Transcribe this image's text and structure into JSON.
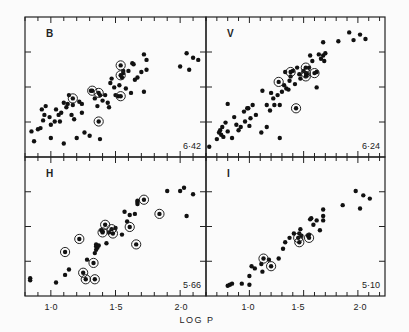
{
  "chart_data": {
    "type": "scatter",
    "title": "",
    "xlabel": "LOG P",
    "ylabel": "",
    "grid": false,
    "legend": "none",
    "shared_xlabel": "LOG P",
    "panels": [
      {
        "band": "B",
        "slope_label": "6·42",
        "position": "top-left",
        "xlim": [
          0.8,
          2.2
        ],
        "ylim": [
          0,
          1
        ],
        "x_ticks": [
          "1·0",
          "1·5",
          "2·0"
        ],
        "points": [
          [
            0.85,
            0.16
          ],
          [
            0.87,
            0.07
          ],
          [
            0.9,
            0.18
          ],
          [
            0.92,
            0.19
          ],
          [
            0.94,
            0.26
          ],
          [
            0.96,
            0.39
          ],
          [
            0.93,
            0.36
          ],
          [
            0.95,
            0.31
          ],
          [
            0.99,
            0.29
          ],
          [
            1.0,
            0.22
          ],
          [
            1.03,
            0.25
          ],
          [
            1.0,
            0.1
          ],
          [
            1.04,
            0.36
          ],
          [
            1.06,
            0.31
          ],
          [
            1.07,
            0.25
          ],
          [
            1.08,
            0.33
          ],
          [
            1.1,
            0.42
          ],
          [
            1.12,
            0.38
          ],
          [
            1.13,
            0.41
          ],
          [
            1.14,
            0.49
          ],
          [
            1.16,
            0.31
          ],
          [
            1.17,
            0.4
          ],
          [
            1.18,
            0.27
          ],
          [
            1.2,
            0.1
          ],
          [
            1.22,
            0.43
          ],
          [
            1.24,
            0.33
          ],
          [
            1.26,
            0.15
          ],
          [
            1.3,
            0.12
          ],
          [
            1.31,
            0.53
          ],
          [
            1.34,
            0.46
          ],
          [
            1.36,
            0.39
          ],
          [
            1.38,
            0.49
          ],
          [
            1.4,
            0.44
          ],
          [
            1.42,
            0.49
          ],
          [
            1.44,
            0.42
          ],
          [
            1.46,
            0.6
          ],
          [
            1.47,
            0.64
          ],
          [
            1.49,
            0.56
          ],
          [
            1.5,
            0.49
          ],
          [
            1.52,
            0.48
          ],
          [
            1.53,
            0.58
          ],
          [
            1.55,
            0.65
          ],
          [
            1.56,
            0.69
          ],
          [
            1.56,
            0.71
          ],
          [
            1.58,
            0.55
          ],
          [
            1.6,
            0.71
          ],
          [
            1.62,
            0.51
          ],
          [
            1.65,
            0.63
          ],
          [
            1.63,
            0.78
          ],
          [
            1.64,
            0.77
          ],
          [
            1.67,
            0.65
          ],
          [
            1.7,
            0.7
          ],
          [
            1.72,
            0.52
          ],
          [
            1.74,
            0.72
          ],
          [
            1.74,
            0.81
          ],
          [
            1.72,
            0.86
          ],
          [
            2.0,
            0.75
          ],
          [
            2.05,
            0.87
          ],
          [
            2.07,
            0.72
          ],
          [
            2.1,
            0.83
          ],
          [
            2.14,
            0.81
          ],
          [
            1.24,
            0.41
          ],
          [
            1.45,
            0.38
          ],
          [
            1.1,
            0.05
          ],
          [
            1.38,
            0.09
          ]
        ],
        "circled": [
          [
            1.17,
            0.46
          ],
          [
            1.32,
            0.53
          ],
          [
            1.37,
            0.51
          ],
          [
            1.37,
            0.25
          ],
          [
            1.54,
            0.48
          ],
          [
            1.54,
            0.67
          ],
          [
            1.54,
            0.76
          ]
        ]
      },
      {
        "band": "V",
        "slope_label": "6·24",
        "position": "top-right",
        "xlim": [
          0.6,
          2.25
        ],
        "ylim": [
          0,
          1
        ],
        "x_ticks": [
          "1·0",
          "1·5",
          "2·0"
        ],
        "points": [
          [
            0.63,
            0.02
          ],
          [
            0.7,
            0.09
          ],
          [
            0.72,
            0.15
          ],
          [
            0.73,
            0.17
          ],
          [
            0.74,
            0.13
          ],
          [
            0.75,
            0.2
          ],
          [
            0.76,
            0.11
          ],
          [
            0.78,
            0.24
          ],
          [
            0.8,
            0.16
          ],
          [
            0.8,
            0.41
          ],
          [
            0.84,
            0.1
          ],
          [
            0.86,
            0.29
          ],
          [
            0.88,
            0.22
          ],
          [
            0.9,
            0.17
          ],
          [
            0.92,
            0.2
          ],
          [
            0.95,
            0.34
          ],
          [
            0.96,
            0.25
          ],
          [
            0.98,
            0.37
          ],
          [
            0.99,
            0.37
          ],
          [
            1.0,
            0.21
          ],
          [
            1.01,
            0.28
          ],
          [
            1.03,
            0.4
          ],
          [
            1.06,
            0.31
          ],
          [
            1.11,
            0.15
          ],
          [
            1.12,
            0.53
          ],
          [
            1.16,
            0.4
          ],
          [
            1.16,
            0.2
          ],
          [
            1.19,
            0.35
          ],
          [
            1.2,
            0.51
          ],
          [
            1.22,
            0.46
          ],
          [
            1.23,
            0.4
          ],
          [
            1.26,
            0.49
          ],
          [
            1.28,
            0.4
          ],
          [
            1.3,
            0.52
          ],
          [
            1.32,
            0.58
          ],
          [
            1.34,
            0.55
          ],
          [
            1.33,
            0.7
          ],
          [
            1.36,
            0.54
          ],
          [
            1.37,
            0.62
          ],
          [
            1.38,
            0.66
          ],
          [
            1.4,
            0.71
          ],
          [
            1.42,
            0.59
          ],
          [
            1.44,
            0.74
          ],
          [
            1.46,
            0.68
          ],
          [
            1.47,
            0.64
          ],
          [
            1.5,
            0.71
          ],
          [
            1.53,
            0.68
          ],
          [
            1.55,
            0.74
          ],
          [
            1.56,
            0.85
          ],
          [
            1.58,
            0.8
          ],
          [
            1.62,
            0.7
          ],
          [
            1.64,
            0.86
          ],
          [
            1.66,
            0.82
          ],
          [
            1.68,
            0.85
          ],
          [
            1.69,
            0.8
          ],
          [
            1.7,
            0.87
          ],
          [
            1.68,
            0.97
          ],
          [
            1.82,
            0.98
          ],
          [
            1.62,
            0.56
          ],
          [
            1.92,
            1.06
          ],
          [
            1.96,
            0.99
          ],
          [
            2.02,
            1.04
          ],
          [
            2.07,
            1.0
          ],
          [
            1.28,
            0.1
          ]
        ],
        "circled": [
          [
            1.27,
            0.61
          ],
          [
            1.38,
            0.7
          ],
          [
            1.43,
            0.37
          ],
          [
            1.52,
            0.66
          ],
          [
            1.52,
            0.69
          ],
          [
            1.52,
            0.74
          ],
          [
            1.6,
            0.69
          ]
        ]
      },
      {
        "band": "H",
        "slope_label": "5·66",
        "position": "bottom-left",
        "xlim": [
          0.8,
          2.2
        ],
        "ylim": [
          0,
          1
        ],
        "x_ticks": [
          "1·0",
          "1·5",
          "2·0"
        ],
        "points": [
          [
            0.84,
            0.09
          ],
          [
            0.84,
            0.07
          ],
          [
            1.04,
            0.05
          ],
          [
            1.11,
            0.12
          ],
          [
            1.14,
            0.17
          ],
          [
            1.28,
            0.26
          ],
          [
            1.34,
            0.32
          ],
          [
            1.35,
            0.4
          ],
          [
            1.35,
            0.38
          ],
          [
            1.36,
            0.37
          ],
          [
            1.35,
            0.35
          ],
          [
            1.37,
            0.39
          ],
          [
            1.39,
            0.53
          ],
          [
            1.4,
            0.52
          ],
          [
            1.43,
            0.41
          ],
          [
            1.45,
            0.51
          ],
          [
            1.5,
            0.55
          ],
          [
            1.55,
            0.49
          ],
          [
            1.57,
            0.7
          ],
          [
            1.59,
            0.61
          ],
          [
            1.61,
            0.67
          ],
          [
            1.65,
            0.68
          ],
          [
            1.67,
            0.79
          ],
          [
            1.67,
            0.8
          ],
          [
            1.67,
            0.77
          ],
          [
            1.9,
            0.89
          ],
          [
            2.0,
            0.89
          ],
          [
            2.03,
            0.92
          ],
          [
            2.05,
            0.66
          ],
          [
            2.1,
            0.86
          ]
        ],
        "circled": [
          [
            1.11,
            0.33
          ],
          [
            1.22,
            0.45
          ],
          [
            1.25,
            0.14
          ],
          [
            1.27,
            0.08
          ],
          [
            1.33,
            0.23
          ],
          [
            1.34,
            0.08
          ],
          [
            1.4,
            0.51
          ],
          [
            1.42,
            0.58
          ],
          [
            1.47,
            0.54
          ],
          [
            1.48,
            0.5
          ],
          [
            1.61,
            0.56
          ],
          [
            1.66,
            0.4
          ],
          [
            1.72,
            0.81
          ],
          [
            1.84,
            0.68
          ]
        ]
      },
      {
        "band": "I",
        "slope_label": "5·10",
        "position": "bottom-right",
        "xlim": [
          0.6,
          2.25
        ],
        "ylim": [
          0,
          1
        ],
        "x_ticks": [
          "1·0",
          "1·5",
          "2·0"
        ],
        "points": [
          [
            0.8,
            0.02
          ],
          [
            0.82,
            0.03
          ],
          [
            0.84,
            0.04
          ],
          [
            0.93,
            0.04
          ],
          [
            1.0,
            0.03
          ],
          [
            1.0,
            0.11
          ],
          [
            1.02,
            0.2
          ],
          [
            1.05,
            0.18
          ],
          [
            1.11,
            0.22
          ],
          [
            1.12,
            0.15
          ],
          [
            1.18,
            0.26
          ],
          [
            1.27,
            0.27
          ],
          [
            1.31,
            0.36
          ],
          [
            1.33,
            0.42
          ],
          [
            1.37,
            0.46
          ],
          [
            1.41,
            0.5
          ],
          [
            1.46,
            0.5
          ],
          [
            1.47,
            0.54
          ],
          [
            1.48,
            0.48
          ],
          [
            1.55,
            0.49
          ],
          [
            1.56,
            0.63
          ],
          [
            1.57,
            0.64
          ],
          [
            1.59,
            0.58
          ],
          [
            1.62,
            0.62
          ],
          [
            1.65,
            0.53
          ],
          [
            1.68,
            0.62
          ],
          [
            1.68,
            0.72
          ],
          [
            1.68,
            0.66
          ],
          [
            1.86,
            0.76
          ],
          [
            1.98,
            0.89
          ],
          [
            2.02,
            0.73
          ],
          [
            2.05,
            0.85
          ],
          [
            2.11,
            0.82
          ],
          [
            1.54,
            0.48
          ]
        ],
        "circled": [
          [
            1.13,
            0.27
          ],
          [
            1.2,
            0.2
          ],
          [
            1.45,
            0.46
          ],
          [
            1.46,
            0.42
          ],
          [
            1.55,
            0.46
          ]
        ]
      }
    ]
  }
}
